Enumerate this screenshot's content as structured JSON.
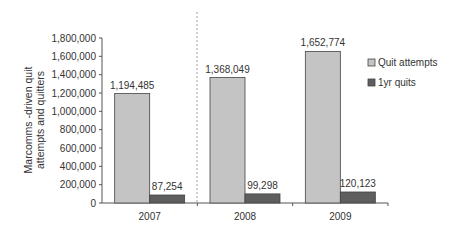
{
  "chart_data": {
    "type": "bar",
    "title": "",
    "xlabel": "",
    "ylabel": "Marcomms -driven quit attempts and quitters",
    "ylabel_lines": [
      "Marcomms -driven quit",
      "attempts and quitters"
    ],
    "categories": [
      "2007",
      "2008",
      "2009"
    ],
    "series": [
      {
        "name": "Quit attempts",
        "color": "#c4c4c4",
        "values": [
          1194485,
          1368049,
          1652774
        ],
        "labels": [
          "1,194,485",
          "1,368,049",
          "1,652,774"
        ]
      },
      {
        "name": "1yr quits",
        "color": "#5e5e5e",
        "values": [
          87254,
          99298,
          120123
        ],
        "labels": [
          "87,254",
          "99,298",
          "120,123"
        ]
      }
    ],
    "ylim": [
      0,
      1800000
    ],
    "yticks": [
      0,
      200000,
      400000,
      600000,
      800000,
      1000000,
      1200000,
      1400000,
      1600000,
      1800000
    ],
    "ytick_labels": [
      "0",
      "200,000",
      "400,000",
      "600,000",
      "800,000",
      "1,000,000",
      "1,200,000",
      "1,400,000",
      "1,600,000",
      "1,800,000"
    ],
    "grid": false,
    "legend_position": "right",
    "annotations": [
      "dashed vertical separator between 2007 and 2008"
    ]
  }
}
